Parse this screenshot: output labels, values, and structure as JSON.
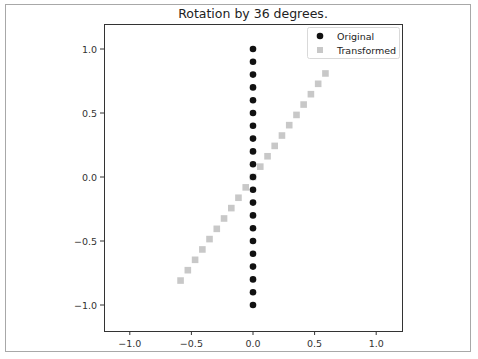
{
  "chart_data": {
    "type": "scatter",
    "title": "Rotation by 36 degrees.",
    "xlabel": "",
    "ylabel": "",
    "xlim": [
      -1.2,
      1.2
    ],
    "ylim": [
      -1.2,
      1.2
    ],
    "xticks": [
      "−1.0",
      "−0.5",
      "0.0",
      "0.5",
      "1.0"
    ],
    "yticks": [
      "1.0",
      "0.5",
      "0.0",
      "−0.5",
      "−1.0"
    ],
    "xtick_values": [
      -1.0,
      -0.5,
      0.0,
      0.5,
      1.0
    ],
    "ytick_values": [
      1.0,
      0.5,
      0.0,
      -0.5,
      -1.0
    ],
    "grid": false,
    "legend_position": "upper right",
    "series": [
      {
        "name": "Original",
        "marker": "circle",
        "color": "#111111",
        "x": [
          0,
          0,
          0,
          0,
          0,
          0,
          0,
          0,
          0,
          0,
          0,
          0,
          0,
          0,
          0,
          0,
          0,
          0,
          0,
          0,
          0
        ],
        "y": [
          -1.0,
          -0.9,
          -0.8,
          -0.7,
          -0.6,
          -0.5,
          -0.4,
          -0.3,
          -0.2,
          -0.1,
          0.0,
          0.1,
          0.2,
          0.3,
          0.4,
          0.5,
          0.6,
          0.7,
          0.8,
          0.9,
          1.0
        ]
      },
      {
        "name": "Transformed",
        "marker": "square",
        "color": "#c8c8c8",
        "x": [
          -0.588,
          -0.529,
          -0.47,
          -0.411,
          -0.353,
          -0.294,
          -0.235,
          -0.176,
          -0.118,
          -0.059,
          0.0,
          0.059,
          0.118,
          0.176,
          0.235,
          0.294,
          0.353,
          0.411,
          0.47,
          0.529,
          0.588
        ],
        "y": [
          -0.809,
          -0.728,
          -0.647,
          -0.566,
          -0.485,
          -0.405,
          -0.324,
          -0.243,
          -0.162,
          -0.081,
          0.0,
          0.081,
          0.162,
          0.243,
          0.324,
          0.405,
          0.485,
          0.566,
          0.647,
          0.728,
          0.809
        ]
      }
    ]
  }
}
